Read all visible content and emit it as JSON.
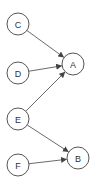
{
  "diagram": {
    "type": "directed-graph",
    "nodes": [
      {
        "id": "C",
        "label": "C",
        "x": 18,
        "y": 24
      },
      {
        "id": "A",
        "label": "A",
        "x": 73,
        "y": 64
      },
      {
        "id": "D",
        "label": "D",
        "x": 18,
        "y": 73
      },
      {
        "id": "E",
        "label": "E",
        "x": 18,
        "y": 119
      },
      {
        "id": "B",
        "label": "B",
        "x": 78,
        "y": 158
      },
      {
        "id": "F",
        "label": "F",
        "x": 18,
        "y": 165
      }
    ],
    "edges": [
      {
        "from": "C",
        "to": "A"
      },
      {
        "from": "D",
        "to": "A"
      },
      {
        "from": "E",
        "to": "A"
      },
      {
        "from": "E",
        "to": "B"
      },
      {
        "from": "F",
        "to": "B"
      }
    ],
    "node_radius": 11,
    "colors": {
      "stroke": "#555555",
      "edge": "#444444",
      "text": "#333333",
      "background": "#ffffff"
    }
  }
}
